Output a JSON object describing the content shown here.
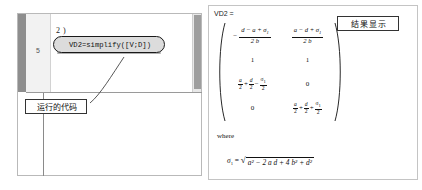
{
  "editor": {
    "line_number": "5",
    "step_label": "2 )",
    "code": "VD2=simplify([V;D])",
    "annotation": "运行的代码"
  },
  "result_panel": {
    "variable_label": "VD2 =",
    "where_label": "where",
    "matrix": {
      "rows": [
        [
          "-(d - a + σ1)/(2 b)",
          "(a - d + σ1)/(2 b)"
        ],
        [
          "1",
          "1"
        ],
        [
          "a/2 + d/2 - σ1/2",
          "0"
        ],
        [
          "0",
          "a/2 + d/2 + σ1/2"
        ]
      ],
      "r1c1": {
        "sign": "−",
        "num": "d − a + σ",
        "num_sub": "1",
        "den": "2 b"
      },
      "r1c2": {
        "num": "a − d + σ",
        "num_sub": "1",
        "den": "2 b"
      },
      "r2c1": "1",
      "r2c2": "1",
      "r3c2": "0",
      "r4c1": "0"
    },
    "sigma_definition": {
      "lhs": "σ",
      "lhs_sub": "1",
      "equals": "=",
      "radicand": "a² − 2 a d + 4 b² + d²"
    }
  },
  "callout": {
    "result_label": "结果显示"
  },
  "colors": {
    "pill_fill": "#dcdcdc",
    "pill_border": "#1a1a1a",
    "panel_border": "#c4c4c4",
    "gutter": "#f2f2f2",
    "bookmark_bar": "#8e8e8e"
  }
}
